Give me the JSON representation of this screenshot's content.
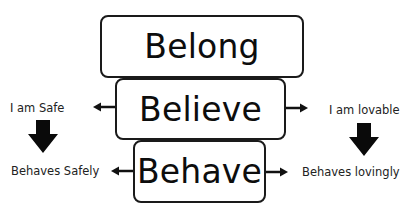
{
  "diagram": {
    "boxes": [
      {
        "id": "belong",
        "label": "Belong"
      },
      {
        "id": "believe",
        "label": "Believe"
      },
      {
        "id": "behave",
        "label": "Behave"
      }
    ],
    "left_branch": {
      "belief": "I am Safe",
      "behaviour": "Behaves Safely"
    },
    "right_branch": {
      "belief": "I am lovable",
      "behaviour": "Behaves lovingly"
    },
    "colors": {
      "stroke": "#1a1a1a",
      "text": "#0d0d0d",
      "background": "#ffffff"
    }
  }
}
